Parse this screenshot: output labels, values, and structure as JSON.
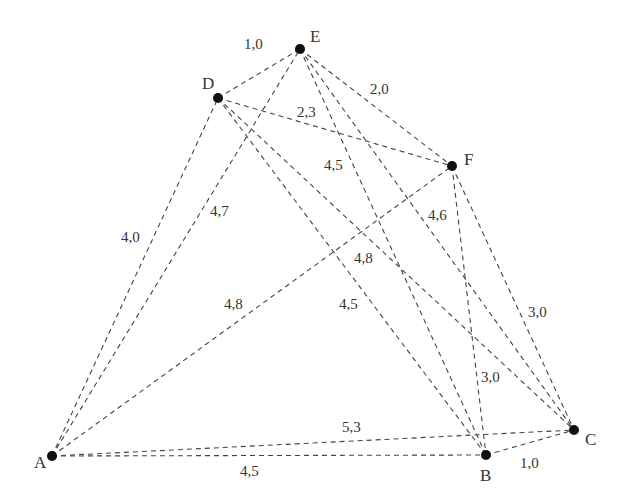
{
  "diagram": {
    "type": "weighted-graph",
    "nodes": [
      {
        "id": "A",
        "label": "A",
        "x": 52,
        "y": 456,
        "lx": 34,
        "ly": 468
      },
      {
        "id": "B",
        "label": "B",
        "x": 486,
        "y": 455,
        "lx": 480,
        "ly": 481
      },
      {
        "id": "C",
        "label": "C",
        "x": 574,
        "y": 430,
        "lx": 585,
        "ly": 445
      },
      {
        "id": "D",
        "label": "D",
        "x": 218,
        "y": 98,
        "lx": 202,
        "ly": 89
      },
      {
        "id": "E",
        "label": "E",
        "x": 300,
        "y": 49,
        "lx": 310,
        "ly": 42
      },
      {
        "id": "F",
        "label": "F",
        "x": 452,
        "y": 166,
        "lx": 464,
        "ly": 165
      }
    ],
    "edges": [
      {
        "from": "D",
        "to": "E",
        "weight": "1,0",
        "lx": 244,
        "ly": 49
      },
      {
        "from": "E",
        "to": "F",
        "weight": "2,0",
        "lx": 370,
        "ly": 94
      },
      {
        "from": "D",
        "to": "F",
        "weight": "2,3",
        "lx": 297,
        "ly": 117
      },
      {
        "from": "A",
        "to": "D",
        "weight": "4,0",
        "lx": 121,
        "ly": 242
      },
      {
        "from": "A",
        "to": "E",
        "weight": "4,7",
        "lx": 210,
        "ly": 216
      },
      {
        "from": "A",
        "to": "F",
        "weight": "4,8",
        "lx": 224,
        "ly": 309
      },
      {
        "from": "D",
        "to": "B",
        "weight": "4,5",
        "lx": 339,
        "ly": 309
      },
      {
        "from": "E",
        "to": "B",
        "weight": "4,5",
        "lx": 324,
        "ly": 170
      },
      {
        "from": "E",
        "to": "C",
        "weight": "4,6",
        "lx": 428,
        "ly": 220
      },
      {
        "from": "D",
        "to": "C",
        "weight": "4,8",
        "lx": 354,
        "ly": 263
      },
      {
        "from": "F",
        "to": "C",
        "weight": "3,0",
        "lx": 528,
        "ly": 317
      },
      {
        "from": "F",
        "to": "B",
        "weight": "3,0",
        "lx": 481,
        "ly": 382
      },
      {
        "from": "A",
        "to": "C",
        "weight": "5,3",
        "lx": 342,
        "ly": 432
      },
      {
        "from": "A",
        "to": "B",
        "weight": "4,5",
        "lx": 240,
        "ly": 476
      },
      {
        "from": "B",
        "to": "C",
        "weight": "1,0",
        "lx": 520,
        "ly": 468
      }
    ]
  }
}
